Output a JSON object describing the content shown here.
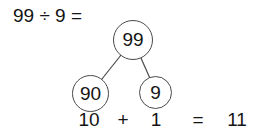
{
  "problem": {
    "label": "99 ÷ 9 ="
  },
  "number_bond": {
    "whole": "99",
    "part_left": "90",
    "part_right": "9"
  },
  "solution": {
    "addend_left": "10",
    "plus_sign": "+",
    "addend_right": "1",
    "equals_sign": "=",
    "result": "11"
  },
  "colors": {
    "ink": "#141414",
    "circle_stroke": "#4a4a4a",
    "background": "#ffffff"
  }
}
